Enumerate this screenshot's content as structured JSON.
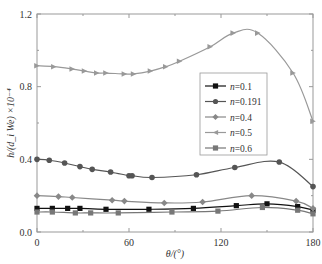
{
  "chart_data": {
    "type": "line",
    "title": "",
    "xlabel": "θ/(°)",
    "ylabel": "h/(d_i We) ×10⁻⁴",
    "xlim": [
      0,
      180
    ],
    "ylim": [
      0.0,
      1.2
    ],
    "x_ticks": [
      0,
      60,
      120,
      180
    ],
    "x_tick_labels": [
      "0",
      "60",
      "120",
      "180"
    ],
    "x_minor_ticks": [
      30,
      90,
      150
    ],
    "y_ticks": [
      0.0,
      0.4,
      0.8,
      1.2
    ],
    "y_tick_labels": [
      "0.0",
      "0.4",
      "0.8",
      "1.2"
    ],
    "y_minor_ticks": [
      0.2,
      0.6,
      1.0
    ],
    "grid": false,
    "legend_position": "center-right",
    "series": [
      {
        "name": "n=0.1",
        "label_italic": "n",
        "label_value": "=0.1",
        "marker": "square",
        "color": "#111111",
        "x": [
          0,
          10,
          20,
          28,
          45,
          73,
          102,
          130,
          150,
          170,
          180
        ],
        "y": [
          0.13,
          0.13,
          0.13,
          0.13,
          0.125,
          0.125,
          0.13,
          0.145,
          0.155,
          0.14,
          0.12
        ]
      },
      {
        "name": "n=0.191",
        "label_italic": "n",
        "label_value": "=0.191",
        "marker": "circle",
        "color": "#555555",
        "x": [
          0,
          8,
          18,
          28,
          36,
          48,
          60,
          62,
          75,
          104,
          129,
          158,
          180
        ],
        "y": [
          0.4,
          0.395,
          0.38,
          0.36,
          0.345,
          0.33,
          0.31,
          0.31,
          0.3,
          0.315,
          0.355,
          0.385,
          0.25
        ]
      },
      {
        "name": "n=0.4",
        "label_italic": "n",
        "label_value": "=0.4",
        "marker": "diamond",
        "color": "#888888",
        "x": [
          0,
          14,
          23,
          49,
          57,
          83,
          108,
          140,
          169,
          180
        ],
        "y": [
          0.2,
          0.195,
          0.19,
          0.175,
          0.17,
          0.16,
          0.165,
          0.2,
          0.17,
          0.13
        ]
      },
      {
        "name": "n=0.5",
        "label_italic": "n",
        "label_value": "=0.5",
        "marker": "triangle-right",
        "color": "#999999",
        "x": [
          0,
          11,
          23,
          31,
          39,
          45,
          57,
          63,
          74,
          84,
          93,
          113,
          128,
          144,
          167,
          180
        ],
        "y": [
          0.915,
          0.91,
          0.897,
          0.886,
          0.875,
          0.875,
          0.87,
          0.87,
          0.886,
          0.91,
          0.94,
          1.02,
          1.095,
          1.095,
          0.875,
          0.61
        ]
      },
      {
        "name": "n=0.6",
        "label_italic": "n",
        "label_value": "=0.6",
        "marker": "square",
        "color": "#777777",
        "x": [
          0,
          10,
          25,
          35,
          53,
          88,
          118,
          147,
          170,
          180
        ],
        "y": [
          0.11,
          0.11,
          0.105,
          0.105,
          0.105,
          0.11,
          0.115,
          0.135,
          0.12,
          0.1
        ]
      }
    ]
  }
}
